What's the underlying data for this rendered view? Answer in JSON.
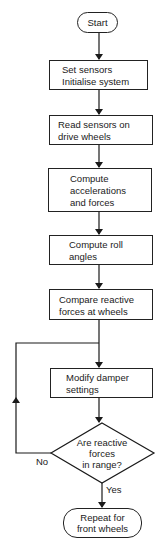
{
  "diagram": {
    "type": "flowchart",
    "nodes": [
      {
        "id": "start",
        "shape": "terminal",
        "label": "Start"
      },
      {
        "id": "init",
        "shape": "process",
        "label": "Set sensors\nInitialise system"
      },
      {
        "id": "read",
        "shape": "process",
        "label": "Read sensors on\ndrive wheels"
      },
      {
        "id": "accel",
        "shape": "process",
        "label": "Compute\naccelerations\nand forces"
      },
      {
        "id": "roll",
        "shape": "process",
        "label": "Compute roll\nangles"
      },
      {
        "id": "compare",
        "shape": "process",
        "label": "Compare reactive\nforces at wheels"
      },
      {
        "id": "modify",
        "shape": "process",
        "label": "Modify damper\nsettings"
      },
      {
        "id": "check",
        "shape": "decision",
        "label": "Are reactive\nforces\nin range?"
      },
      {
        "id": "repeat",
        "shape": "terminal",
        "label": "Repeat for\nfront wheels"
      }
    ],
    "edges": [
      {
        "from": "start",
        "to": "init",
        "label": ""
      },
      {
        "from": "init",
        "to": "read",
        "label": ""
      },
      {
        "from": "read",
        "to": "accel",
        "label": ""
      },
      {
        "from": "accel",
        "to": "roll",
        "label": ""
      },
      {
        "from": "roll",
        "to": "compare",
        "label": ""
      },
      {
        "from": "compare",
        "to": "modify",
        "label": ""
      },
      {
        "from": "modify",
        "to": "check",
        "label": ""
      },
      {
        "from": "check",
        "to": "modify",
        "label": "No"
      },
      {
        "from": "check",
        "to": "repeat",
        "label": "Yes"
      }
    ],
    "edge_labels": {
      "no": "No",
      "yes": "Yes"
    }
  }
}
